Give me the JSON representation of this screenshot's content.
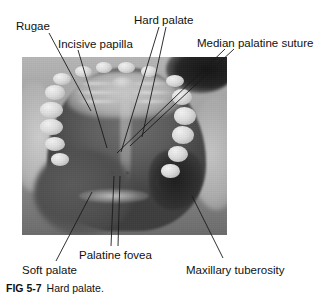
{
  "figure": {
    "caption_number": "FIG 5-7",
    "caption_text": "Hard palate.",
    "alt": "Intraoral photograph of the hard palate viewed from below, with anatomical structures labeled"
  },
  "photo": {
    "type": "grayscale-photograph",
    "subject": "hard palate intraoral view",
    "frame": {
      "x": 22,
      "y": 57,
      "width": 205,
      "height": 178
    }
  },
  "labels": [
    {
      "id": "rugae",
      "text": "Rugae",
      "x": 16,
      "y": 21,
      "leaders": [
        {
          "x1": 49,
          "y1": 33,
          "x2": 91,
          "y2": 111
        }
      ]
    },
    {
      "id": "incisive-papilla",
      "text": "Incisive papilla",
      "x": 58,
      "y": 39,
      "leaders": [
        {
          "x1": 78,
          "y1": 50,
          "x2": 107,
          "y2": 148
        }
      ]
    },
    {
      "id": "hard-palate",
      "text": "Hard palate",
      "x": 134,
      "y": 15,
      "leaders": [
        {
          "x1": 159,
          "y1": 27,
          "x2": 121,
          "y2": 152
        },
        {
          "x1": 166,
          "y1": 27,
          "x2": 142,
          "y2": 137
        }
      ]
    },
    {
      "id": "median-palatine-suture",
      "text": "Median palatine suture",
      "x": 197,
      "y": 38,
      "leaders": [
        {
          "x1": 225,
          "y1": 49,
          "x2": 117,
          "y2": 153
        },
        {
          "x1": 234,
          "y1": 49,
          "x2": 130,
          "y2": 146
        }
      ]
    },
    {
      "id": "soft-palate",
      "text": "Soft palate",
      "x": 22,
      "y": 265,
      "leaders": [
        {
          "x1": 56,
          "y1": 261,
          "x2": 92,
          "y2": 192
        }
      ]
    },
    {
      "id": "palatine-fovea",
      "text": "Palatine fovea",
      "x": 79,
      "y": 250,
      "leaders": [
        {
          "x1": 111,
          "y1": 246,
          "x2": 114,
          "y2": 176
        },
        {
          "x1": 118,
          "y1": 246,
          "x2": 120,
          "y2": 176
        }
      ]
    },
    {
      "id": "maxillary-tuberosity",
      "text": "Maxillary tuberosity",
      "x": 186,
      "y": 265,
      "leaders": [
        {
          "x1": 223,
          "y1": 258,
          "x2": 192,
          "y2": 196
        }
      ]
    }
  ],
  "colors": {
    "background": "#ffffff",
    "text": "#111111",
    "leader_line": "#1a1a1a"
  }
}
